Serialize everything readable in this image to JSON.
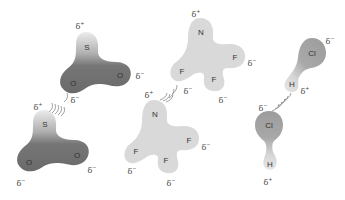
{
  "diagram": {
    "colors": {
      "so2_dark": "#6f6f6f",
      "so2_light": "#e6e6e6",
      "nf3_fill": "#d9d9d9",
      "hcl_cl": "#a3a3a3",
      "hcl_h": "#dddddd",
      "text": "#333333",
      "dashes": "#888888"
    },
    "molecules": [
      {
        "name": "SO2 (top)",
        "atoms": [
          {
            "symbol": "S",
            "x": 87,
            "y": 47
          },
          {
            "symbol": "O",
            "x": 73,
            "y": 83
          },
          {
            "symbol": "O",
            "x": 120,
            "y": 75
          }
        ],
        "charges": [
          {
            "symbol": "δ",
            "sign": "+",
            "x": 80,
            "y": 26
          },
          {
            "symbol": "δ",
            "sign": "−",
            "x": 140,
            "y": 76
          },
          {
            "symbol": "δ",
            "sign": "−",
            "x": 75,
            "y": 100
          }
        ]
      },
      {
        "name": "SO2 (bottom)",
        "atoms": [
          {
            "symbol": "S",
            "x": 45,
            "y": 124
          },
          {
            "symbol": "O",
            "x": 29,
            "y": 162
          },
          {
            "symbol": "O",
            "x": 77,
            "y": 155
          }
        ],
        "charges": [
          {
            "symbol": "δ",
            "sign": "+",
            "x": 38,
            "y": 107
          },
          {
            "symbol": "δ",
            "sign": "−",
            "x": 92,
            "y": 170
          },
          {
            "symbol": "δ",
            "sign": "−",
            "x": 21,
            "y": 183
          }
        ]
      },
      {
        "name": "NF3 (top)",
        "atoms": [
          {
            "symbol": "N",
            "x": 201,
            "y": 32
          },
          {
            "symbol": "F",
            "x": 182,
            "y": 71
          },
          {
            "symbol": "F",
            "x": 235,
            "y": 57
          },
          {
            "symbol": "F",
            "x": 214,
            "y": 79
          }
        ],
        "charges": [
          {
            "symbol": "δ",
            "sign": "+",
            "x": 196,
            "y": 14
          },
          {
            "symbol": "δ",
            "sign": "−",
            "x": 252,
            "y": 63
          },
          {
            "symbol": "δ",
            "sign": "−",
            "x": 188,
            "y": 91
          },
          {
            "symbol": "δ",
            "sign": "−",
            "x": 223,
            "y": 100
          }
        ]
      },
      {
        "name": "NF3 (bottom)",
        "atoms": [
          {
            "symbol": "N",
            "x": 155,
            "y": 114
          },
          {
            "symbol": "F",
            "x": 136,
            "y": 151
          },
          {
            "symbol": "F",
            "x": 189,
            "y": 140
          },
          {
            "symbol": "F",
            "x": 166,
            "y": 160
          }
        ],
        "charges": [
          {
            "symbol": "δ",
            "sign": "+",
            "x": 149,
            "y": 95
          },
          {
            "symbol": "δ",
            "sign": "−",
            "x": 206,
            "y": 147
          },
          {
            "symbol": "δ",
            "sign": "−",
            "x": 132,
            "y": 171
          },
          {
            "symbol": "δ",
            "sign": "−",
            "x": 171,
            "y": 183
          }
        ]
      },
      {
        "name": "HCl (top)",
        "atoms": [
          {
            "symbol": "Cl",
            "x": 312,
            "y": 53
          },
          {
            "symbol": "H",
            "x": 292,
            "y": 84
          }
        ],
        "charges": [
          {
            "symbol": "δ",
            "sign": "−",
            "x": 330,
            "y": 41
          },
          {
            "symbol": "δ",
            "sign": "+",
            "x": 305,
            "y": 91
          }
        ]
      },
      {
        "name": "HCl (bottom)",
        "atoms": [
          {
            "symbol": "Cl",
            "x": 269,
            "y": 125
          },
          {
            "symbol": "H",
            "x": 270,
            "y": 164
          }
        ],
        "charges": [
          {
            "symbol": "δ",
            "sign": "−",
            "x": 263,
            "y": 108
          },
          {
            "symbol": "δ",
            "sign": "+",
            "x": 268,
            "y": 182
          }
        ]
      }
    ]
  }
}
